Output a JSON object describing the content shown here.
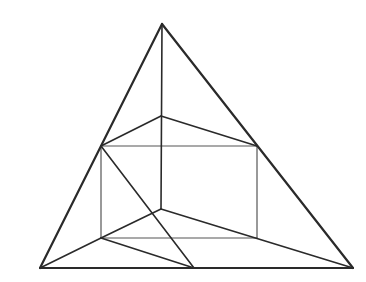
{
  "diagram": {
    "type": "geometric-line-drawing",
    "width": 366,
    "height": 282,
    "colors": {
      "background": "#ffffff",
      "stroke": "#2a2a2a",
      "stroke_light": "#555555"
    },
    "points": {
      "apex": [
        162,
        24
      ],
      "bottom_left": [
        40,
        268
      ],
      "bottom_right": [
        353,
        268
      ],
      "bottom_mid": [
        194,
        268
      ],
      "inner_top": [
        161,
        116
      ],
      "inner_bottom": [
        161,
        209
      ],
      "rect_top_left": [
        101,
        146
      ],
      "rect_top_right": [
        257,
        146
      ],
      "rect_bottom_left": [
        101,
        238
      ],
      "rect_bottom_right": [
        257,
        238
      ]
    },
    "segments": [
      {
        "id": "outer-left",
        "from": "apex",
        "to": "bottom_left",
        "weight": "heavy"
      },
      {
        "id": "outer-right",
        "from": "apex",
        "to": "bottom_right",
        "weight": "heavy"
      },
      {
        "id": "outer-base",
        "from": "bottom_left",
        "to": "bottom_right",
        "weight": "heavy"
      },
      {
        "id": "center-vertical",
        "from": "apex",
        "to": "inner_bottom",
        "weight": "medium"
      },
      {
        "id": "upper-left-slope",
        "from": "rect_top_left",
        "to": "inner_top",
        "weight": "medium"
      },
      {
        "id": "upper-right-slope",
        "from": "inner_top",
        "to": "rect_top_right",
        "weight": "medium"
      },
      {
        "id": "rect-top",
        "from": "rect_top_left",
        "to": "rect_top_right",
        "weight": "light"
      },
      {
        "id": "rect-left",
        "from": "rect_top_left",
        "to": "rect_bottom_left",
        "weight": "light"
      },
      {
        "id": "rect-right",
        "from": "rect_top_right",
        "to": "rect_bottom_right",
        "weight": "light"
      },
      {
        "id": "rect-bottom",
        "from": "rect_bottom_left",
        "to": "rect_bottom_right",
        "weight": "light"
      },
      {
        "id": "lower-left-slope",
        "from": "rect_bottom_left",
        "to": "inner_bottom",
        "weight": "medium"
      },
      {
        "id": "lower-right-slope",
        "from": "inner_bottom",
        "to": "bottom_right",
        "weight": "medium"
      },
      {
        "id": "base-left-slope",
        "from": "bottom_left",
        "to": "rect_bottom_left",
        "weight": "medium"
      },
      {
        "id": "base-to-mid",
        "from": "rect_bottom_left",
        "to": "bottom_mid",
        "weight": "medium"
      },
      {
        "id": "diagonal",
        "from": "rect_top_left",
        "to": "bottom_mid",
        "weight": "medium"
      }
    ]
  }
}
